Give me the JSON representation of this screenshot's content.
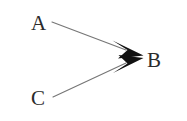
{
  "diagram": {
    "background_color": "#ffffff",
    "stroke_color": "#6e6e6e",
    "arrowhead_color": "#111111",
    "label_color": "#2b2b2b",
    "nodes": [
      {
        "id": "a",
        "label": "A",
        "x": 31,
        "y": 13
      },
      {
        "id": "c",
        "label": "C",
        "x": 31,
        "y": 88
      },
      {
        "id": "b",
        "label": "B",
        "x": 147,
        "y": 50
      }
    ],
    "edges": [
      {
        "id": "a-to-b",
        "from": "A",
        "to": "B",
        "x1": 52,
        "y1": 22,
        "x2": 138,
        "y2": 54,
        "arrowhead": "filled-triangle"
      },
      {
        "id": "c-to-b",
        "from": "C",
        "to": "B",
        "x1": 53,
        "y1": 97,
        "x2": 138,
        "y2": 60,
        "arrowhead": "filled-triangle"
      }
    ]
  }
}
